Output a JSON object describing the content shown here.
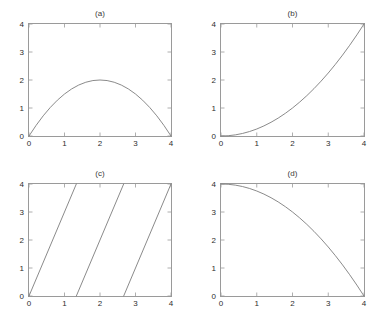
{
  "figure": {
    "background_color": "#ffffff",
    "axis_color": "#9a9a9a",
    "curve_color": "#7d7d7d",
    "text_color": "#2e2e2e",
    "panel_count": 4
  },
  "chart_data": [
    {
      "type": "line",
      "title": "(a)",
      "xlabel": "",
      "ylabel": "",
      "xlim": [
        0,
        4
      ],
      "ylim": [
        0,
        4
      ],
      "xticks": [
        0,
        1,
        2,
        3,
        4
      ],
      "yticks": [
        0,
        1,
        2,
        3,
        4
      ],
      "xticklabels": [
        "0",
        "1",
        "2",
        "3",
        "4"
      ],
      "yticklabels": [
        "0",
        "1",
        "2",
        "3",
        "4"
      ],
      "grid": false,
      "legend": null,
      "series": [
        {
          "name": "downward parabola",
          "expression": "y = x(4 - x)/2",
          "x": [
            0,
            0.2,
            0.4,
            0.6,
            0.8,
            1,
            1.2,
            1.4,
            1.6,
            1.8,
            2,
            2.2,
            2.4,
            2.6,
            2.8,
            3,
            3.2,
            3.4,
            3.6,
            3.8,
            4
          ],
          "values": [
            0,
            0.38,
            0.72,
            1.02,
            1.28,
            1.5,
            1.68,
            1.82,
            1.92,
            1.98,
            2,
            1.98,
            1.92,
            1.82,
            1.68,
            1.5,
            1.28,
            1.02,
            0.72,
            0.38,
            0
          ]
        }
      ]
    },
    {
      "type": "line",
      "title": "(b)",
      "xlabel": "",
      "ylabel": "",
      "xlim": [
        0,
        4
      ],
      "ylim": [
        0,
        4
      ],
      "xticks": [
        0,
        1,
        2,
        3,
        4
      ],
      "yticks": [
        0,
        1,
        2,
        3,
        4
      ],
      "xticklabels": [
        "0",
        "1",
        "2",
        "3",
        "4"
      ],
      "yticklabels": [
        "0",
        "1",
        "2",
        "3",
        "4"
      ],
      "grid": false,
      "legend": null,
      "series": [
        {
          "name": "convex increasing quadratic",
          "expression": "y = x^2/4",
          "x": [
            0,
            0.2,
            0.4,
            0.6,
            0.8,
            1,
            1.2,
            1.4,
            1.6,
            1.8,
            2,
            2.2,
            2.4,
            2.6,
            2.8,
            3,
            3.2,
            3.4,
            3.6,
            3.8,
            4
          ],
          "values": [
            0,
            0.01,
            0.04,
            0.09,
            0.16,
            0.25,
            0.36,
            0.49,
            0.64,
            0.81,
            1,
            1.21,
            1.44,
            1.69,
            1.96,
            2.25,
            2.56,
            2.89,
            3.24,
            3.61,
            4
          ]
        }
      ]
    },
    {
      "type": "line",
      "title": "(c)",
      "xlabel": "",
      "ylabel": "",
      "xlim": [
        0,
        4
      ],
      "ylim": [
        0,
        4
      ],
      "xticks": [
        0,
        1,
        2,
        3,
        4
      ],
      "yticks": [
        0,
        1,
        2,
        3,
        4
      ],
      "xticklabels": [
        "0",
        "1",
        "2",
        "3",
        "4"
      ],
      "yticklabels": [
        "0",
        "1",
        "2",
        "3",
        "4"
      ],
      "grid": false,
      "legend": null,
      "series": [
        {
          "name": "sawtooth ramp 1",
          "expression": "y = 3x, 0 <= x <= 4/3",
          "x": [
            0,
            1.3333
          ],
          "values": [
            0,
            4
          ]
        },
        {
          "name": "sawtooth ramp 2",
          "expression": "y = 3(x - 4/3), 4/3 <= x <= 8/3",
          "x": [
            1.3333,
            2.6667
          ],
          "values": [
            0,
            4
          ]
        },
        {
          "name": "sawtooth ramp 3",
          "expression": "y = 3(x - 8/3), 8/3 <= x <= 4",
          "x": [
            2.6667,
            4
          ],
          "values": [
            0,
            4
          ]
        }
      ]
    },
    {
      "type": "line",
      "title": "(d)",
      "xlabel": "",
      "ylabel": "",
      "xlim": [
        0,
        4
      ],
      "ylim": [
        0,
        4
      ],
      "xticks": [
        0,
        1,
        2,
        3,
        4
      ],
      "yticks": [
        0,
        1,
        2,
        3,
        4
      ],
      "xticklabels": [
        "0",
        "1",
        "2",
        "3",
        "4"
      ],
      "yticklabels": [
        "0",
        "1",
        "2",
        "3",
        "4"
      ],
      "grid": false,
      "legend": null,
      "series": [
        {
          "name": "concave decreasing quadratic",
          "expression": "y = 4 - x^2/4",
          "x": [
            0,
            0.2,
            0.4,
            0.6,
            0.8,
            1,
            1.2,
            1.4,
            1.6,
            1.8,
            2,
            2.2,
            2.4,
            2.6,
            2.8,
            3,
            3.2,
            3.4,
            3.6,
            3.8,
            4
          ],
          "values": [
            4,
            3.99,
            3.96,
            3.91,
            3.84,
            3.75,
            3.64,
            3.51,
            3.36,
            3.19,
            3,
            2.79,
            2.56,
            2.31,
            2.04,
            1.75,
            1.44,
            1.11,
            0.76,
            0.39,
            0
          ]
        }
      ]
    }
  ],
  "panels": [
    {
      "id": "a",
      "title": "(a)"
    },
    {
      "id": "b",
      "title": "(b)"
    },
    {
      "id": "c",
      "title": "(c)"
    },
    {
      "id": "d",
      "title": "(d)"
    }
  ]
}
